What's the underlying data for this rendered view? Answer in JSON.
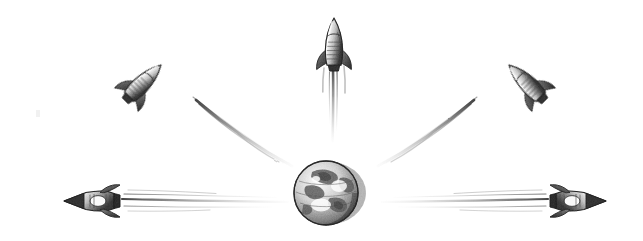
{
  "illustration": {
    "title": "Rockets launching outward from planet Earth",
    "medium": "pencil halftone line drawing",
    "background_color": "#ffffff",
    "ink_color": "#4a4a4a",
    "ink_dark": "#2b2b2b",
    "ink_light": "#9a9a9a",
    "canvas": {
      "width": 643,
      "height": 241
    }
  },
  "earth": {
    "label": "Earth globe",
    "center_x": 326,
    "center_y": 193,
    "radius": 32,
    "features": [
      "continents",
      "oceans",
      "equator-band",
      "shaded-limb"
    ]
  },
  "rockets": [
    {
      "id": "rocket-top",
      "label": "Top rocket",
      "heading_deg": 0,
      "nose_x": 334,
      "nose_y": 18,
      "trail_length": 118
    },
    {
      "id": "rocket-upper-left",
      "label": "Upper-left rocket",
      "heading_deg": -45,
      "nose_x": 159,
      "nose_y": 63,
      "trail_length": 150
    },
    {
      "id": "rocket-upper-right",
      "label": "Upper-right rocket",
      "heading_deg": 45,
      "nose_x": 511,
      "nose_y": 63,
      "trail_length": 150
    },
    {
      "id": "rocket-lower-left",
      "label": "Lower-left rocket",
      "heading_deg": -90,
      "nose_x": 64,
      "nose_y": 201,
      "trail_length": 190
    },
    {
      "id": "rocket-lower-right",
      "label": "Lower-right rocket",
      "heading_deg": 90,
      "nose_x": 606,
      "nose_y": 201,
      "trail_length": 190
    }
  ],
  "artifacts": [
    {
      "id": "scan-speck",
      "label": "Faint scan speck",
      "x": 38,
      "y": 113
    }
  ]
}
